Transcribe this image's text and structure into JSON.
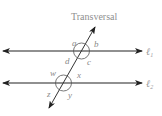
{
  "diagram": {
    "title": "Transversal",
    "lines": [
      {
        "id": "l1",
        "symbol": "ℓ",
        "subscript": "1"
      },
      {
        "id": "l2",
        "symbol": "ℓ",
        "subscript": "2"
      }
    ],
    "angles_top": {
      "a": "a",
      "b": "b",
      "c": "c",
      "d": "d"
    },
    "angles_bottom": {
      "w": "w",
      "x": "x",
      "y": "y",
      "z": "z"
    },
    "colors": {
      "line": "#222222",
      "arc": "#555555",
      "label": "#8a8a8a"
    }
  }
}
